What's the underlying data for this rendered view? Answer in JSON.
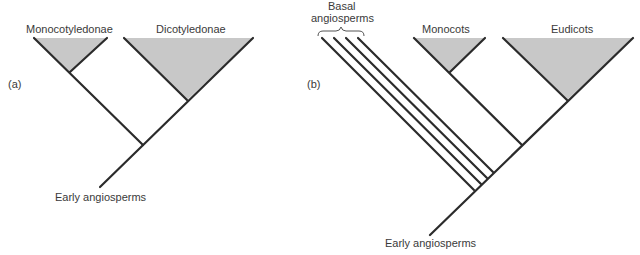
{
  "panels": [
    {
      "id": "a",
      "label": "(a)",
      "root_label": "Early angiosperms",
      "clades": [
        {
          "name": "Monocotyledonae",
          "shaded": true
        },
        {
          "name": "Dicotyledonae",
          "shaded": true
        }
      ]
    },
    {
      "id": "b",
      "label": "(b)",
      "root_label": "Early angiosperms",
      "basal_group_label_line1": "Basal",
      "basal_group_label_line2": "angiosperms",
      "basal_lineage_count": 4,
      "clades": [
        {
          "name": "Monocots",
          "shaded": true
        },
        {
          "name": "Eudicots",
          "shaded": true
        }
      ]
    }
  ],
  "colors": {
    "line": "#2b2b2b",
    "triangle_fill": "#c8c8c8"
  }
}
